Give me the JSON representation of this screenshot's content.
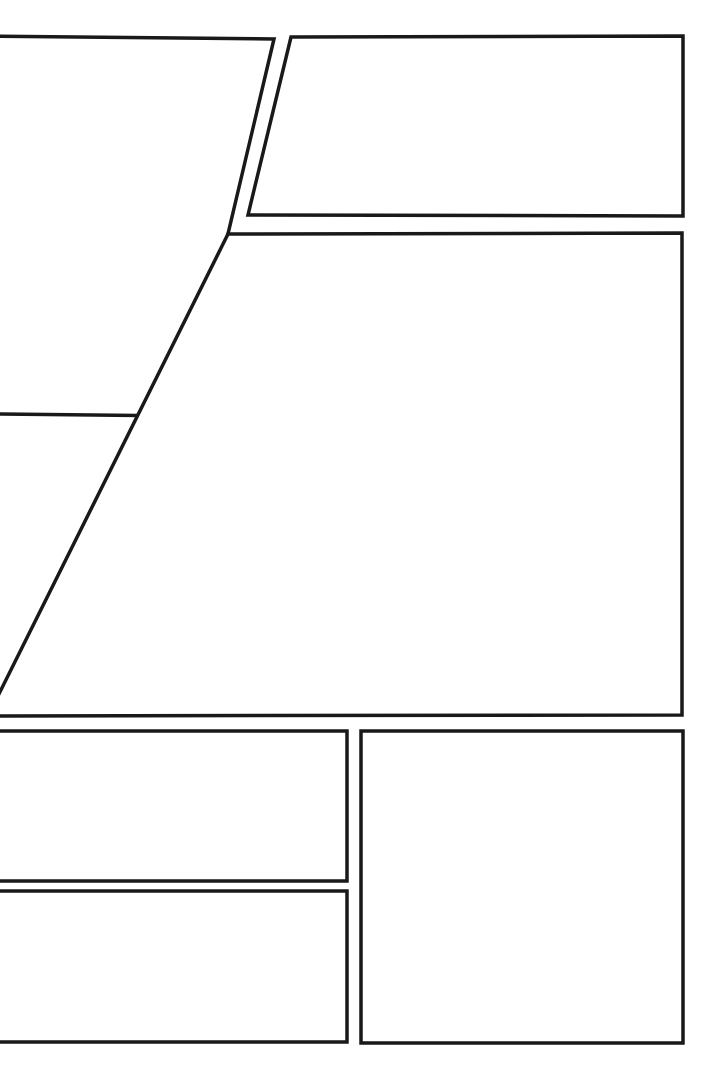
{
  "page": {
    "kind": "comic-page-layout",
    "width": 722,
    "height": 1077,
    "background_color": "#ffffff",
    "ink_color": "#191919",
    "border_width_px": 3.5,
    "panel_count": 6,
    "content_text": ""
  },
  "panels": [
    {
      "id": "panel-1",
      "name": "panel-top-left",
      "label": "",
      "shape": "quadrilateral",
      "bleed": "left",
      "points": "-12,36 274,39 185,416 -12,414",
      "description": "Tall left panel with a slanted right edge, bleeding off the left page edge."
    },
    {
      "id": "panel-2",
      "name": "panel-top-right",
      "label": "",
      "shape": "quadrilateral",
      "bleed": "none",
      "points": "291,37 683,36 683,216 248,215",
      "description": "Wide upper-right panel with a slightly slanted left edge."
    },
    {
      "id": "panel-3",
      "name": "panel-middle-wide",
      "label": "",
      "shape": "quadrilateral",
      "bleed": "left",
      "points": "228,234 682,233 682,715 -12,716",
      "description": "Large middle panel spanning the page width, with a slanted upper-left edge, bleeding off the left page edge."
    },
    {
      "id": "panel-4",
      "name": "panel-lower-left-upper",
      "label": "",
      "shape": "rectangle",
      "bleed": "left",
      "points": "-12,731 347,731 347,881 -12,881",
      "description": "Lower-left upper rectangular panel, bleeding off the left page edge."
    },
    {
      "id": "panel-5",
      "name": "panel-lower-left-lower",
      "label": "",
      "shape": "rectangle",
      "bleed": "left",
      "points": "-12,891 347,891 347,1042 -12,1042",
      "description": "Lower-left lower rectangular panel, bleeding off the left page edge."
    },
    {
      "id": "panel-6",
      "name": "panel-lower-right-tall",
      "label": "",
      "shape": "rectangle",
      "bleed": "none",
      "points": "361,731 683,731 683,1043 361,1043",
      "description": "Tall lower-right rectangular panel."
    }
  ],
  "gutters": {
    "vertical_between_panel4_5_and_6_x": 354,
    "horizontal_between_panel4_and_5_y": 886,
    "horizontal_between_panel3_and_row_y": 723,
    "horizontal_between_panel2_and_panel3_y": 225
  },
  "margins": {
    "top_px": 36,
    "right_px": 39,
    "bottom_px": 34,
    "left_px": 0
  }
}
